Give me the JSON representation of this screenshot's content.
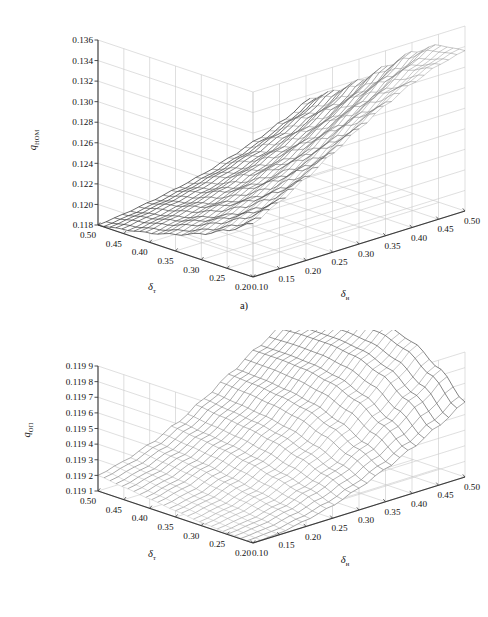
{
  "figure": {
    "panels": [
      {
        "id": "a",
        "caption": "a)",
        "z_axis": {
          "title_main": "q",
          "title_sub": "НОМ",
          "ticks": [
            "0.136",
            "0.134",
            "0.132",
            "0.130",
            "0.128",
            "0.126",
            "0.124",
            "0.122",
            "0.120",
            "0.118"
          ]
        },
        "x_axis": {
          "title_main": "δ",
          "title_sub": "т",
          "ticks": [
            "0.50",
            "0.45",
            "0.40",
            "0.35",
            "0.30",
            "0.25",
            "0.20"
          ]
        },
        "y_axis": {
          "title_main": "δ",
          "title_sub": "н",
          "ticks": [
            "0.10",
            "0.15",
            "0.20",
            "0.25",
            "0.30",
            "0.35",
            "0.40",
            "0.45",
            "0.50"
          ]
        }
      },
      {
        "id": "b",
        "caption": "b)",
        "z_axis": {
          "title_main": "q",
          "title_sub": "ОП",
          "ticks": [
            "0.119 9",
            "0.119 8",
            "0.119 7",
            "0.119 6",
            "0.119 5",
            "0.119 4",
            "0.119 3",
            "0.119 2",
            "0.119 1"
          ]
        },
        "x_axis": {
          "title_main": "δ",
          "title_sub": "т",
          "ticks": [
            "0.50",
            "0.45",
            "0.40",
            "0.35",
            "0.30",
            "0.25",
            "0.20"
          ]
        },
        "y_axis": {
          "title_main": "δ",
          "title_sub": "н",
          "ticks": [
            "0.10",
            "0.15",
            "0.20",
            "0.25",
            "0.30",
            "0.35",
            "0.40",
            "0.45",
            "0.50"
          ]
        }
      }
    ]
  },
  "chart_data": [
    {
      "type": "surface",
      "panel": "a",
      "title": "",
      "xlabel": "δт",
      "ylabel": "δн",
      "zlabel": "qНОМ",
      "xlim": [
        0.2,
        0.5
      ],
      "ylim": [
        0.1,
        0.5
      ],
      "zlim": [
        0.118,
        0.136
      ],
      "xticks": [
        0.5,
        0.45,
        0.4,
        0.35,
        0.3,
        0.25,
        0.2
      ],
      "yticks": [
        0.1,
        0.15,
        0.2,
        0.25,
        0.3,
        0.35,
        0.4,
        0.45,
        0.5
      ],
      "zticks": [
        0.118,
        0.12,
        0.122,
        0.124,
        0.126,
        0.128,
        0.13,
        0.132,
        0.134,
        0.136
      ],
      "grid": true,
      "legend": "none",
      "description": "Monotonic rising mesh surface: minimum near delta_t = 0.50 / delta_n = 0.10 corner, maximum ridge at delta_t = 0.20 / delta_n = 0.50 corner.",
      "x": [
        0.5,
        0.45,
        0.4,
        0.35,
        0.3,
        0.25,
        0.2
      ],
      "y": [
        0.1,
        0.15,
        0.2,
        0.25,
        0.3,
        0.35,
        0.4,
        0.45,
        0.5
      ],
      "z": [
        [
          0.118,
          0.1183,
          0.1187,
          0.1192,
          0.1198,
          0.1206,
          0.1215,
          0.1226,
          0.1239
        ],
        [
          0.1184,
          0.1188,
          0.1193,
          0.1199,
          0.1207,
          0.1216,
          0.1227,
          0.124,
          0.1255
        ],
        [
          0.1189,
          0.1194,
          0.12,
          0.1208,
          0.1218,
          0.1229,
          0.1242,
          0.1257,
          0.1274
        ],
        [
          0.1196,
          0.1202,
          0.121,
          0.122,
          0.1232,
          0.1246,
          0.1261,
          0.1278,
          0.1296
        ],
        [
          0.1205,
          0.1213,
          0.1223,
          0.1236,
          0.125,
          0.1266,
          0.1283,
          0.1301,
          0.1318
        ],
        [
          0.1217,
          0.1227,
          0.124,
          0.1255,
          0.1271,
          0.1288,
          0.1305,
          0.1321,
          0.1333
        ],
        [
          0.1232,
          0.1245,
          0.126,
          0.1276,
          0.1292,
          0.1307,
          0.132,
          0.133,
          0.1336
        ]
      ]
    },
    {
      "type": "surface",
      "panel": "b",
      "title": "",
      "xlabel": "δт",
      "ylabel": "δн",
      "zlabel": "qОП",
      "xlim": [
        0.2,
        0.5
      ],
      "ylim": [
        0.1,
        0.5
      ],
      "zlim": [
        0.1191,
        0.1199
      ],
      "xticks": [
        0.5,
        0.45,
        0.4,
        0.35,
        0.3,
        0.25,
        0.2
      ],
      "yticks": [
        0.1,
        0.15,
        0.2,
        0.25,
        0.3,
        0.35,
        0.4,
        0.45,
        0.5
      ],
      "zticks": [
        0.1191,
        0.1192,
        0.1193,
        0.1194,
        0.1195,
        0.1196,
        0.1197,
        0.1198,
        0.1199
      ],
      "grid": true,
      "legend": "none",
      "description": "Saddle-like mesh with a raised ridge toward the far (high delta_n, mid delta_t) corner and low flat plateau along the near edge.",
      "x": [
        0.5,
        0.45,
        0.4,
        0.35,
        0.3,
        0.25,
        0.2
      ],
      "y": [
        0.1,
        0.15,
        0.2,
        0.25,
        0.3,
        0.35,
        0.4,
        0.45,
        0.5
      ],
      "z": [
        [
          0.1192,
          0.11924,
          0.1193,
          0.11938,
          0.11948,
          0.11959,
          0.1197,
          0.1198,
          0.11988
        ],
        [
          0.11918,
          0.11922,
          0.11928,
          0.11936,
          0.11946,
          0.11958,
          0.1197,
          0.11981,
          0.1199
        ],
        [
          0.11916,
          0.1192,
          0.11926,
          0.11934,
          0.11944,
          0.11956,
          0.11969,
          0.11981,
          0.11991
        ],
        [
          0.11914,
          0.11917,
          0.11923,
          0.11931,
          0.11941,
          0.11953,
          0.11966,
          0.11979,
          0.1199
        ],
        [
          0.11912,
          0.11915,
          0.1192,
          0.11927,
          0.11936,
          0.11947,
          0.1196,
          0.11973,
          0.11985
        ],
        [
          0.11911,
          0.11913,
          0.11917,
          0.11923,
          0.1193,
          0.11939,
          0.1195,
          0.11962,
          0.11974
        ],
        [
          0.1191,
          0.11911,
          0.11914,
          0.11918,
          0.11924,
          0.11931,
          0.11939,
          0.11948,
          0.11958
        ]
      ]
    }
  ]
}
